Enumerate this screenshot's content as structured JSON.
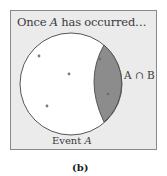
{
  "figure": {
    "caption": "(b)",
    "title_prefix": "Once ",
    "title_var": "A",
    "title_suffix": " has occurred…",
    "event_label_prefix": "Event ",
    "event_label_var": "A",
    "intersection_label": "A ∩ B",
    "colors": {
      "panel_bg": "#ebebeb",
      "panel_border": "#8a8a8a",
      "circle_fill": "#ffffff",
      "circle_stroke": "#555555",
      "intersection_fill": "#8c8c8c",
      "dot": "#7a7a7a",
      "text": "#3a3a3a"
    },
    "circle": {
      "cx": 71,
      "cy": 84,
      "r": 51
    },
    "points": [
      {
        "x": 39,
        "y": 56
      },
      {
        "x": 69,
        "y": 74
      },
      {
        "x": 47,
        "y": 106
      },
      {
        "x": 100,
        "y": 59
      },
      {
        "x": 108,
        "y": 94
      }
    ]
  }
}
